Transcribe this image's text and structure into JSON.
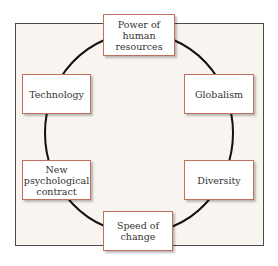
{
  "diagram": {
    "nodes": [
      {
        "id": "power",
        "label": "Power of\nhuman\nresources"
      },
      {
        "id": "globalism",
        "label": "Globalism"
      },
      {
        "id": "diversity",
        "label": "Diversity"
      },
      {
        "id": "speed",
        "label": "Speed of\nchange"
      },
      {
        "id": "contract",
        "label": "New\npsychological\ncontract"
      },
      {
        "id": "technology",
        "label": "Technology"
      }
    ],
    "colors": {
      "box_border": "#c0705e",
      "frame_bg": "#f8f4f0",
      "ring": "#111111"
    }
  }
}
